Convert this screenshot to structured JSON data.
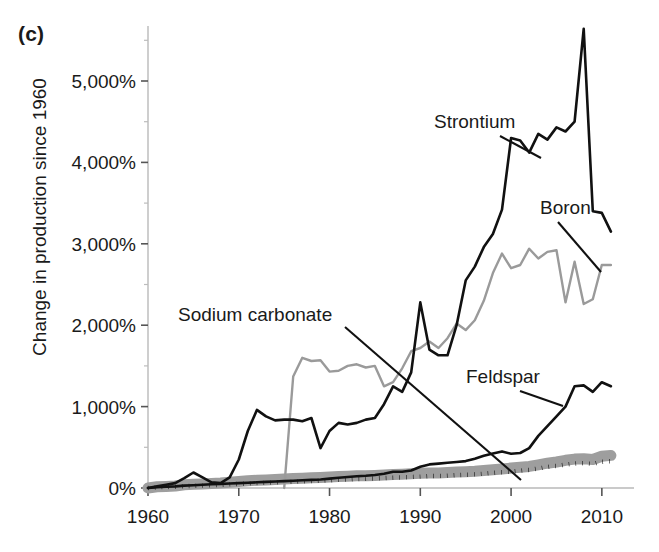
{
  "panel": {
    "label": "(c)"
  },
  "axes": {
    "ylabel": "Change in production since 1960",
    "xlabel": "",
    "ytick_labels": [
      "0%",
      "1,000%",
      "2,000%",
      "3,000%",
      "4,000%",
      "5,000%"
    ],
    "ytick_values": [
      0,
      1000,
      2000,
      3000,
      4000,
      5000
    ],
    "xtick_labels": [
      "1960",
      "1970",
      "1980",
      "1990",
      "2000",
      "2010"
    ],
    "xtick_values": [
      1960,
      1970,
      1980,
      1990,
      2000,
      2010
    ]
  },
  "colors": {
    "black": "#111111",
    "gray_line": "#9a9a9a",
    "gray_band": "#9e9e9e",
    "axis": "#b9b9b9"
  },
  "annotations": [
    {
      "name": "Strontium",
      "text_x": 434,
      "text_y": 128,
      "lx1": 500,
      "ly1": 136,
      "lx2": 541,
      "ly2": 158
    },
    {
      "name": "Boron",
      "text_x": 540,
      "text_y": 214,
      "lx1": 558,
      "ly1": 222,
      "lx2": 601,
      "ly2": 272
    },
    {
      "name": "Sodium carbonate",
      "text_x": 178,
      "text_y": 321,
      "lx1": 345,
      "ly1": 327,
      "lx2": 521,
      "ly2": 480
    },
    {
      "name": "Feldspar",
      "text_x": 466,
      "text_y": 383,
      "lx1": 520,
      "ly1": 391,
      "lx2": 563,
      "ly2": 406
    }
  ],
  "chart_data": {
    "type": "line",
    "title": "",
    "xlabel": "",
    "ylabel": "Change in production since 1960",
    "xlim": [
      1960,
      2012
    ],
    "ylim": [
      0,
      5700
    ],
    "grid": false,
    "legend": "inline-annotations",
    "x": [
      1960,
      1961,
      1962,
      1963,
      1964,
      1965,
      1966,
      1967,
      1968,
      1969,
      1970,
      1971,
      1972,
      1973,
      1974,
      1975,
      1976,
      1977,
      1978,
      1979,
      1980,
      1981,
      1982,
      1983,
      1984,
      1985,
      1986,
      1987,
      1988,
      1989,
      1990,
      1991,
      1992,
      1993,
      1994,
      1995,
      1996,
      1997,
      1998,
      1999,
      2000,
      2001,
      2002,
      2003,
      2004,
      2005,
      2006,
      2007,
      2008,
      2009,
      2010,
      2011
    ],
    "series": [
      {
        "name": "Strontium",
        "style": "solid",
        "color": "#111111",
        "width": 2.6,
        "values": [
          0,
          20,
          40,
          60,
          120,
          190,
          130,
          70,
          60,
          130,
          350,
          700,
          960,
          880,
          830,
          840,
          840,
          820,
          860,
          490,
          700,
          800,
          780,
          800,
          840,
          860,
          1030,
          1250,
          1180,
          1420,
          2280,
          1700,
          1630,
          1630,
          2000,
          2550,
          2720,
          2960,
          3120,
          3420,
          4300,
          4270,
          4120,
          4350,
          4280,
          4430,
          4380,
          4500,
          5640,
          3400,
          3380,
          3150
        ]
      },
      {
        "name": "Boron",
        "style": "solid",
        "color": "#9a9a9a",
        "width": 2.4,
        "values": [
          null,
          null,
          null,
          null,
          null,
          null,
          null,
          null,
          null,
          null,
          null,
          null,
          null,
          null,
          null,
          0,
          1370,
          1600,
          1560,
          1570,
          1430,
          1440,
          1500,
          1520,
          1480,
          1500,
          1250,
          1300,
          1470,
          1680,
          1720,
          1800,
          1720,
          1840,
          2020,
          1940,
          2060,
          2300,
          2640,
          2880,
          2700,
          2740,
          2940,
          2820,
          2900,
          2920,
          2280,
          2780,
          2260,
          2320,
          2740,
          2740
        ]
      },
      {
        "name": "Sodium carbonate",
        "style": "band",
        "color": "#9e9e9e",
        "width": 11,
        "values": [
          0,
          15,
          20,
          25,
          40,
          45,
          50,
          55,
          60,
          70,
          80,
          90,
          95,
          100,
          105,
          110,
          115,
          120,
          125,
          130,
          135,
          140,
          145,
          150,
          150,
          155,
          160,
          165,
          170,
          175,
          180,
          185,
          185,
          190,
          195,
          200,
          205,
          215,
          225,
          235,
          245,
          255,
          265,
          285,
          305,
          320,
          340,
          355,
          360,
          350,
          390,
          400
        ]
      },
      {
        "name": "Feldspar",
        "style": "solid",
        "color": "#111111",
        "width": 2.6,
        "values": [
          0,
          10,
          15,
          20,
          30,
          35,
          40,
          45,
          50,
          55,
          60,
          65,
          70,
          75,
          80,
          85,
          90,
          95,
          100,
          105,
          115,
          125,
          135,
          145,
          150,
          160,
          175,
          200,
          200,
          215,
          260,
          290,
          300,
          310,
          320,
          330,
          360,
          395,
          425,
          450,
          420,
          430,
          490,
          640,
          760,
          880,
          1000,
          1250,
          1260,
          1180,
          1300,
          1250
        ]
      },
      {
        "name": "dotted-series",
        "style": "dotted",
        "color": "#111111",
        "width": 4.4,
        "values": [
          0,
          8,
          12,
          16,
          22,
          26,
          30,
          34,
          38,
          44,
          50,
          55,
          60,
          64,
          68,
          72,
          76,
          80,
          85,
          90,
          95,
          100,
          105,
          110,
          112,
          118,
          122,
          126,
          130,
          136,
          140,
          146,
          148,
          152,
          158,
          162,
          168,
          176,
          186,
          194,
          202,
          212,
          222,
          240,
          258,
          272,
          288,
          300,
          306,
          296,
          322,
          330
        ]
      }
    ]
  }
}
